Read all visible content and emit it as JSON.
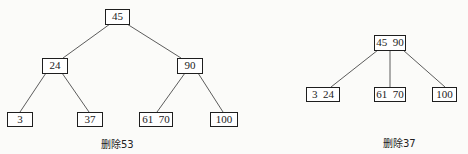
{
  "diagram": {
    "type": "b-tree-deletion",
    "left_tree": {
      "caption": "删除53",
      "nodes": {
        "root": "45",
        "n24": "24",
        "n90": "90",
        "n3": "3",
        "n37": "37",
        "n6170": "61  70",
        "n100": "100"
      },
      "edges": [
        [
          "45",
          "24"
        ],
        [
          "45",
          "90"
        ],
        [
          "24",
          "3"
        ],
        [
          "24",
          "37"
        ],
        [
          "90",
          "61 70"
        ],
        [
          "90",
          "100"
        ]
      ]
    },
    "right_tree": {
      "caption": "删除37",
      "nodes": {
        "root": "45  90",
        "n324": "3  24",
        "n6170": "61  70",
        "n100": "100"
      },
      "edges": [
        [
          "45 90",
          "3 24"
        ],
        [
          "45 90",
          "61 70"
        ],
        [
          "45 90",
          "100"
        ]
      ]
    }
  }
}
